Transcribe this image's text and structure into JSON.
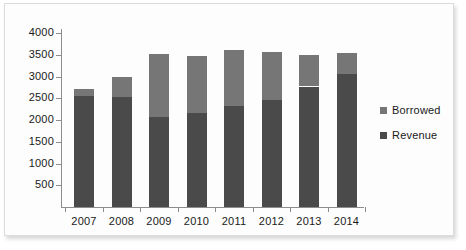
{
  "chart_data": {
    "type": "bar",
    "subtype": "stacked-vertical",
    "title": "",
    "subtitle": "",
    "xlabel": "",
    "ylabel": "",
    "categories": [
      "2007",
      "2008",
      "2009",
      "2010",
      "2011",
      "2012",
      "2013",
      "2014"
    ],
    "series": [
      {
        "name": "Revenue",
        "color": "#4a4a4a",
        "values": [
          2560,
          2520,
          2080,
          2150,
          2320,
          2450,
          2770,
          3050
        ]
      },
      {
        "name": "Borrowed",
        "color": "#767676",
        "values": [
          160,
          460,
          1440,
          1320,
          1300,
          1110,
          720,
          490
        ]
      }
    ],
    "totals": [
      2720,
      2980,
      3520,
      3470,
      3620,
      3560,
      3490,
      3540
    ],
    "ylim": [
      0,
      4000
    ],
    "ytick_values": [
      500,
      1000,
      1500,
      2000,
      2500,
      3000,
      3500,
      4000
    ],
    "ytick_labels": [
      "500",
      "1000",
      "1500",
      "2000",
      "2500",
      "3000",
      "3500",
      "4000"
    ],
    "grid": false,
    "legend_position": "right",
    "legend_order": [
      "Borrowed",
      "Revenue"
    ],
    "stack_order_bottom_to_top": [
      "Revenue",
      "Borrowed"
    ]
  },
  "legend": {
    "entries": [
      {
        "label": "Borrowed",
        "color": "#767676"
      },
      {
        "label": "Revenue",
        "color": "#4a4a4a"
      }
    ]
  },
  "colors": {
    "revenue": "#4a4a4a",
    "borrowed": "#767676",
    "axis": "#8d8d8d",
    "text": "#1a1a1a",
    "card_background": "#fdfdfd",
    "card_border": "#dcdcdc"
  }
}
